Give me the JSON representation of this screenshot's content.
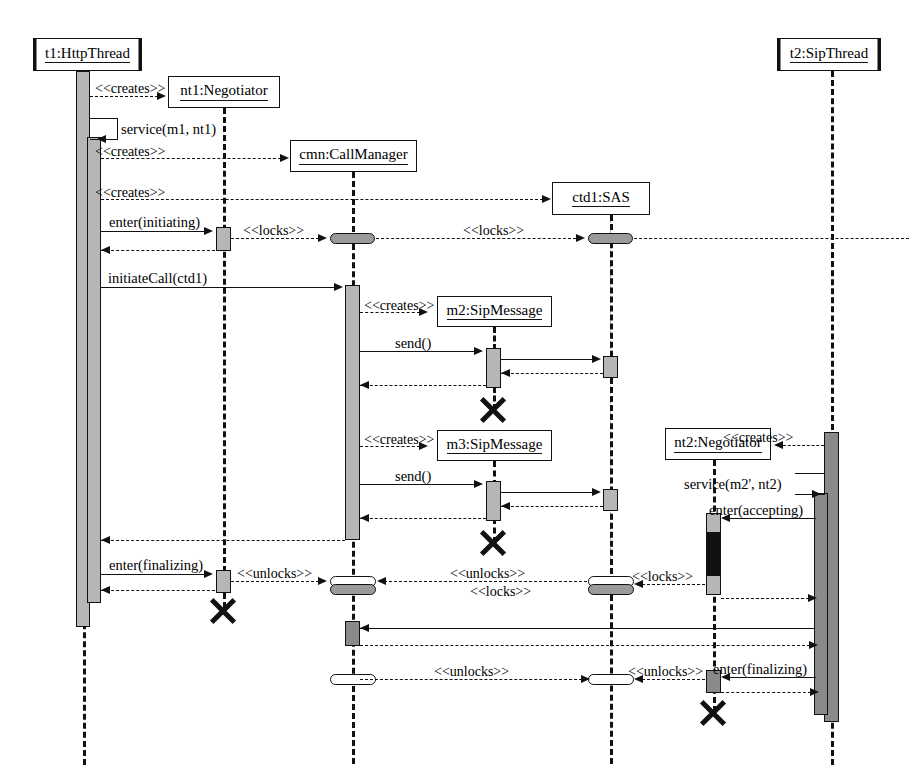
{
  "diagram": {
    "kind": "uml-sequence-diagram"
  },
  "participants": [
    {
      "id": "t1",
      "label": "t1:HttpThread",
      "active_object": true,
      "x": 33,
      "y": 38,
      "w": 109,
      "h": 33,
      "lifeline_x": 83,
      "lifeline_style": "thick"
    },
    {
      "id": "nt1",
      "label": "nt1:Negotiator",
      "active_object": false,
      "x": 168,
      "y": 76,
      "w": 112,
      "h": 32,
      "lifeline_x": 223,
      "lifeline_style": "thick"
    },
    {
      "id": "cmn",
      "label": "cmn:CallManager",
      "active_object": false,
      "x": 290,
      "y": 140,
      "w": 127,
      "h": 32,
      "lifeline_x": 352,
      "lifeline_style": "thick"
    },
    {
      "id": "ctd1",
      "label": "ctd1:SAS",
      "active_object": false,
      "x": 552,
      "y": 182,
      "w": 98,
      "h": 33,
      "lifeline_x": 600,
      "lifeline_style": "thick"
    },
    {
      "id": "m2",
      "label": "m2:SipMessage",
      "active_object": false,
      "x": 437,
      "y": 296,
      "w": 115,
      "h": 31,
      "lifeline_x": 493,
      "lifeline_style": "thick"
    },
    {
      "id": "m3",
      "label": "m3:SipMessage",
      "active_object": false,
      "x": 437,
      "y": 430,
      "w": 115,
      "h": 31,
      "lifeline_x": 493,
      "lifeline_style": "thick"
    },
    {
      "id": "nt2",
      "label": "nt2:Negotiator",
      "active_object": false,
      "x": 665,
      "y": 428,
      "w": 106,
      "h": 32,
      "lifeline_x": 713,
      "lifeline_style": "thick"
    },
    {
      "id": "t2",
      "label": "t2:SipThread",
      "active_object": true,
      "x": 777,
      "y": 38,
      "w": 104,
      "h": 33,
      "lifeline_x": 831,
      "lifeline_style": "thick"
    }
  ],
  "messages": [
    {
      "id": "m-create-nt1",
      "label": "<<creates>>",
      "kind": "create",
      "from": "t1",
      "to": "nt1",
      "y": 96
    },
    {
      "id": "m-service-m1",
      "label": "service(m1, nt1)",
      "kind": "self",
      "from": "t1",
      "to": "t1",
      "y": 130
    },
    {
      "id": "m-create-cmn",
      "label": "<<creates>>",
      "kind": "create",
      "from": "t1",
      "to": "cmn",
      "y": 158
    },
    {
      "id": "m-create-ctd1",
      "label": "<<creates>>",
      "kind": "create",
      "from": "t1",
      "to": "ctd1",
      "y": 199
    },
    {
      "id": "m-enter-init",
      "label": "enter(initiating)",
      "kind": "call",
      "from": "t1",
      "to": "nt1",
      "y": 229
    },
    {
      "id": "m-locks-1",
      "label": "<<locks>>",
      "kind": "lock",
      "from": "nt1",
      "to": "cmn",
      "y": 238
    },
    {
      "id": "m-locks-2",
      "label": "<<locks>>",
      "kind": "lock",
      "from": "cmn",
      "to": "ctd1",
      "y": 238
    },
    {
      "id": "m-ret-init",
      "label": "",
      "kind": "return",
      "from": "nt1",
      "to": "t1",
      "y": 248
    },
    {
      "id": "m-initiatecall",
      "label": "initiateCall(ctd1)",
      "kind": "call",
      "from": "t1",
      "to": "cmn",
      "y": 285
    },
    {
      "id": "m-create-m2",
      "label": "<<creates>>",
      "kind": "create",
      "from": "cmn",
      "to": "m2",
      "y": 311
    },
    {
      "id": "m-send-1",
      "label": "send()",
      "kind": "call",
      "from": "cmn",
      "to": "m2",
      "y": 350
    },
    {
      "id": "m-m2-to-sas",
      "label": "",
      "kind": "call",
      "from": "m2",
      "to": "ctd1",
      "y": 359
    },
    {
      "id": "m-sas-ret-1",
      "label": "",
      "kind": "return",
      "from": "ctd1",
      "to": "m2",
      "y": 372
    },
    {
      "id": "m-ret-send-1",
      "label": "",
      "kind": "return",
      "from": "m2",
      "to": "cmn",
      "y": 384
    },
    {
      "id": "m-destroy-m2",
      "label": "",
      "kind": "destroy",
      "from": "m2",
      "to": "m2",
      "y": 407
    },
    {
      "id": "m-create-m3",
      "label": "<<creates>>",
      "kind": "create",
      "from": "cmn",
      "to": "m3",
      "y": 445
    },
    {
      "id": "m-send-2",
      "label": "send()",
      "kind": "call",
      "from": "cmn",
      "to": "m3",
      "y": 483
    },
    {
      "id": "m-m3-to-sas",
      "label": "",
      "kind": "call",
      "from": "m3",
      "to": "ctd1",
      "y": 491
    },
    {
      "id": "m-sas-ret-2",
      "label": "",
      "kind": "return",
      "from": "ctd1",
      "to": "m3",
      "y": 505
    },
    {
      "id": "m-ret-send-2",
      "label": "",
      "kind": "return",
      "from": "m3",
      "to": "cmn",
      "y": 517
    },
    {
      "id": "m-destroy-m3",
      "label": "",
      "kind": "destroy",
      "from": "m3",
      "to": "m3",
      "y": 540
    },
    {
      "id": "m-create-nt2",
      "label": "<<creates>>",
      "kind": "create",
      "from": "t2",
      "to": "nt2",
      "y": 444
    },
    {
      "id": "m-service-m2p",
      "label": "service(m2', nt2)",
      "kind": "self",
      "from": "t2",
      "to": "t2",
      "y": 486
    },
    {
      "id": "m-enter-accept",
      "label": "enter(accepting)",
      "kind": "call",
      "from": "t2",
      "to": "nt2",
      "y": 517
    },
    {
      "id": "m-ret-cmn",
      "label": "",
      "kind": "return",
      "from": "cmn",
      "to": "t1",
      "y": 538
    },
    {
      "id": "m-enter-final1",
      "label": "enter(finalizing)",
      "kind": "call",
      "from": "t1",
      "to": "nt1",
      "y": 573
    },
    {
      "id": "m-unlocks-1",
      "label": "<<unlocks>>",
      "kind": "unlock",
      "from": "nt1",
      "to": "cmn",
      "y": 581
    },
    {
      "id": "m-unlocks-2",
      "label": "<<unlocks>>",
      "kind": "unlock",
      "from": "ctd1",
      "to": "cmn",
      "y": 581
    },
    {
      "id": "m-locks-3",
      "label": "<<locks>>",
      "kind": "lock",
      "from": "nt2",
      "to": "ctd1",
      "y": 584
    },
    {
      "id": "m-ret-final1",
      "label": "",
      "kind": "return",
      "from": "nt1",
      "to": "t1",
      "y": 589
    },
    {
      "id": "m-locks-4",
      "label": "<<locks>>",
      "kind": "lock",
      "from": "nt2",
      "to": "t2",
      "y": 598
    },
    {
      "id": "m-destroy-nt1",
      "label": "",
      "kind": "destroy",
      "from": "nt1",
      "to": "nt1",
      "y": 608
    },
    {
      "id": "m-cmn-back",
      "label": "",
      "kind": "call",
      "from": "t2",
      "to": "cmn",
      "y": 628
    },
    {
      "id": "m-cmn-ret2",
      "label": "",
      "kind": "return",
      "from": "cmn",
      "to": "t2",
      "y": 642
    },
    {
      "id": "m-unlocks-3",
      "label": "<<unlocks>>",
      "kind": "unlock",
      "from": "cmn",
      "to": "ctd1",
      "y": 679
    },
    {
      "id": "m-unlocks-4",
      "label": "<<unlocks>>",
      "kind": "unlock",
      "from": "nt2",
      "to": "ctd1",
      "y": 679
    },
    {
      "id": "m-enter-final2",
      "label": "enter(finalizing)",
      "kind": "call",
      "from": "t2",
      "to": "nt2",
      "y": 676
    },
    {
      "id": "m-ret-final2",
      "label": "",
      "kind": "return",
      "from": "nt2",
      "to": "t2",
      "y": 690
    },
    {
      "id": "m-destroy-nt2",
      "label": "",
      "kind": "destroy",
      "from": "nt2",
      "to": "nt2",
      "y": 706
    }
  ],
  "labels": {
    "creates": "<<creates>>",
    "locks": "<<locks>>",
    "unlocks": "<<unlocks>>",
    "service_m1": "service(m1, nt1)",
    "service_m2p": "service(m2', nt2)",
    "enter_initiating": "enter(initiating)",
    "enter_accepting": "enter(accepting)",
    "enter_finalizing": "enter(finalizing)",
    "initiate_call": "initiateCall(ctd1)",
    "send": "send()"
  },
  "colors": {
    "line": "#111111",
    "activation_fill": "#b6b6b6",
    "activation_blocked": "#111111",
    "lock_token_fill": "#9a9a9a",
    "unlock_token_fill": "#ffffff",
    "faint_lifeline": "#aaaaaa",
    "background": "#ffffff"
  }
}
